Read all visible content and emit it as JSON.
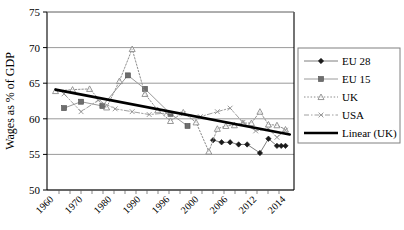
{
  "chart_data": {
    "type": "line",
    "title": "",
    "xlabel": "",
    "ylabel": "Wages as % of GDP",
    "ylim": [
      50,
      75
    ],
    "ytick_values": [
      50,
      55,
      60,
      65,
      70,
      75
    ],
    "ytick_labels": [
      "50",
      "55",
      "60",
      "65",
      "70",
      "75"
    ],
    "xtick_labels": [
      "1960",
      "1970",
      "1980",
      "1990",
      "1996",
      "2000",
      "2006",
      "2012",
      "2014"
    ],
    "xtick_positions": [
      1960,
      1970,
      1980,
      1990,
      1996,
      2000,
      2006,
      2012,
      2014
    ],
    "xlim": [
      1958,
      2016
    ],
    "grid": "horizontal",
    "legend_position": "right-outside",
    "series": [
      {
        "name": "EU 28",
        "marker": "diamond",
        "line_style": "solid",
        "color": "#7f7f7f",
        "marker_color": "#1a1a1a",
        "x": [
          1997,
          1999,
          2001,
          2003,
          2005,
          2008,
          2010,
          2012,
          2013,
          2014
        ],
        "values": [
          57.0,
          56.7,
          56.7,
          56.4,
          56.4,
          55.2,
          57.2,
          56.2,
          56.2,
          56.2
        ]
      },
      {
        "name": "EU 15",
        "marker": "square",
        "line_style": "solid",
        "color": "#9a9a9a",
        "marker_color": "#6e6e6e",
        "x": [
          1962,
          1966,
          1971,
          1977,
          1981,
          1987,
          1991
        ],
        "values": [
          61.5,
          62.4,
          61.8,
          66.1,
          64.2,
          60.7,
          59.0
        ]
      },
      {
        "name": "UK",
        "marker": "triangle-open",
        "line_style": "dotted",
        "color": "#8c8c8c",
        "marker_color": "#8c8c8c",
        "x": [
          1960,
          1964,
          1968,
          1972,
          1975,
          1978,
          1981,
          1984,
          1987,
          1990,
          1993,
          1996,
          1998,
          2000,
          2002,
          2004,
          2006,
          2008,
          2010,
          2012,
          2014
        ],
        "values": [
          63.9,
          64.1,
          64.2,
          61.6,
          65.3,
          69.8,
          63.5,
          61.2,
          59.7,
          60.9,
          59.5,
          55.4,
          58.6,
          59.0,
          59.1,
          59.4,
          59.4,
          61.0,
          59.2,
          59.1,
          58.5
        ]
      },
      {
        "name": "USA",
        "marker": "x",
        "line_style": "dashdot",
        "color": "#a0a0a0",
        "marker_color": "#8f8f8f",
        "x": [
          1962,
          1966,
          1970,
          1974,
          1978,
          1982,
          1986,
          1990,
          1994,
          1998,
          2001,
          2004,
          2007,
          2010,
          2012,
          2014
        ],
        "values": [
          63.5,
          61.0,
          62.6,
          61.4,
          61.0,
          60.6,
          60.8,
          60.7,
          60.3,
          61.0,
          61.5,
          59.5,
          58.3,
          58.6,
          57.4,
          58.4
        ]
      },
      {
        "name": "Linear (UK)",
        "marker": "none",
        "line_style": "thick-solid",
        "color": "#000000",
        "trend": true,
        "x": [
          1960,
          2015
        ],
        "values": [
          64.1,
          57.8
        ]
      }
    ],
    "legend_entries": [
      {
        "label": "EU 28",
        "marker": "diamond",
        "line_style": "solid"
      },
      {
        "label": "EU 15",
        "marker": "square",
        "line_style": "solid"
      },
      {
        "label": "UK",
        "marker": "triangle-open",
        "line_style": "dotted"
      },
      {
        "label": "USA",
        "marker": "x",
        "line_style": "dashdot"
      },
      {
        "label": "Linear (UK)",
        "marker": "none",
        "line_style": "thick-solid"
      }
    ]
  },
  "colors": {
    "plot_border": "#000000",
    "gridline": "#808080",
    "background": "#ffffff",
    "trendline": "#000000",
    "legend_border": "#808080"
  }
}
